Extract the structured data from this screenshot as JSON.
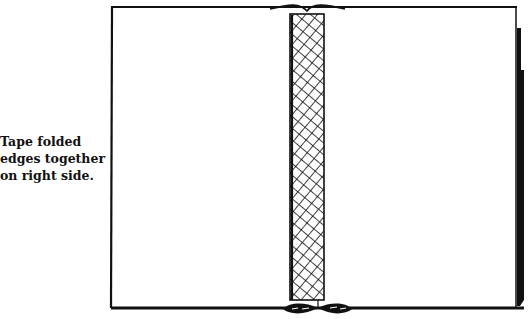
{
  "caption": "Tape folded\nedges together\non right side.",
  "colors": {
    "ink": "#111111",
    "background": "#ffffff"
  }
}
